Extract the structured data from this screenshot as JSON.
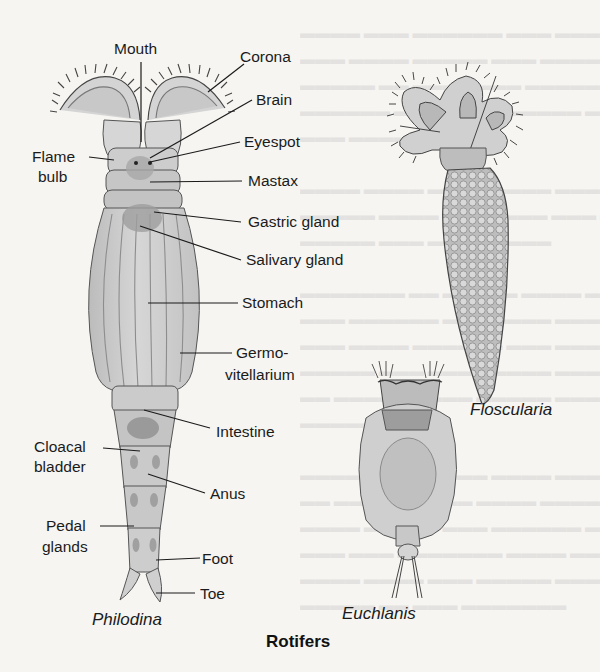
{
  "figure": {
    "title": "Rotifers",
    "species": [
      {
        "name": "Philodina"
      },
      {
        "name": "Floscularia"
      },
      {
        "name": "Euchlanis"
      }
    ],
    "philodina_labels": {
      "mouth": "Mouth",
      "corona": "Corona",
      "brain": "Brain",
      "eyespot": "Eyespot",
      "flame_bulb_1": "Flame",
      "flame_bulb_2": "bulb",
      "mastax": "Mastax",
      "gastric_gland": "Gastric gland",
      "salivary_gland": "Salivary gland",
      "stomach": "Stomach",
      "germovitellarium_1": "Germo-",
      "germovitellarium_2": "vitellarium",
      "intestine": "Intestine",
      "cloacal_bladder_1": "Cloacal",
      "cloacal_bladder_2": "bladder",
      "anus": "Anus",
      "pedal_glands_1": "Pedal",
      "pedal_glands_2": "glands",
      "foot": "Foot",
      "toe": "Toe"
    },
    "colors": {
      "background": "#f6f5f2",
      "ink": "#1b1b1b",
      "body_fill": "#cfcfcf",
      "body_shade": "#a9a9a9"
    }
  }
}
